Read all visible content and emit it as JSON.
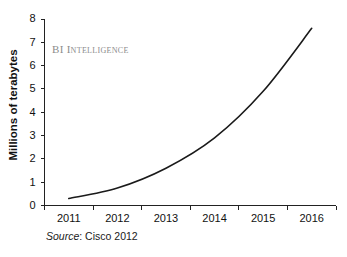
{
  "chart_data": {
    "type": "line",
    "title": "",
    "subtitle": "",
    "xlabel": "",
    "ylabel": "Millions of terabytes",
    "categories": [
      "2011",
      "2012",
      "2013",
      "2014",
      "2015",
      "2016"
    ],
    "x": [
      2011,
      2012,
      2013,
      2014,
      2015,
      2016
    ],
    "series": [
      {
        "name": "Global data center traffic",
        "values": [
          0.3,
          0.75,
          1.6,
          2.9,
          4.9,
          7.6
        ]
      }
    ],
    "ylim": [
      0,
      8
    ],
    "yticks": [
      0,
      1,
      2,
      3,
      4,
      5,
      6,
      7,
      8
    ],
    "ytick_labels": [
      "0",
      "1",
      "2",
      "3",
      "4",
      "5",
      "6",
      "7",
      "8"
    ],
    "xtick_labels": [
      "2011",
      "2012",
      "2013",
      "2014",
      "2015",
      "2016"
    ],
    "grid": false,
    "legend": false,
    "legend_position": "none",
    "line_color": "#1a1a1a",
    "axis_color": "#222222"
  },
  "annotations": {
    "watermark": "BI Intelligence",
    "watermark_color": "#8c8c8c",
    "source_label": "Source",
    "source_value": ": Cisco 2012"
  }
}
